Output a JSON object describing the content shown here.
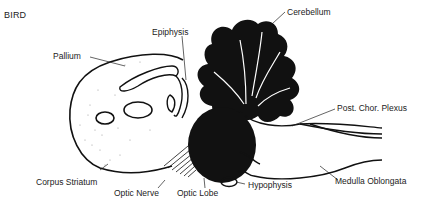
{
  "title": "BIRD",
  "labels": {
    "epiphysis": "Epiphysis",
    "cerebellum": "Cerebellum",
    "pallium": "Pallium",
    "post_chor_plexus": "Post. Chor. Plexus",
    "corpus_striatum": "Corpus Striatum",
    "optic_nerve": "Optic Nerve",
    "optic_lobe": "Optic Lobe",
    "hypophysis": "Hypophysis",
    "medulla_oblongata": "Medulla Oblongata"
  },
  "colors": {
    "ink": "#111111",
    "text": "#222222",
    "stipple": "#9a9a9a",
    "background": "#ffffff"
  }
}
